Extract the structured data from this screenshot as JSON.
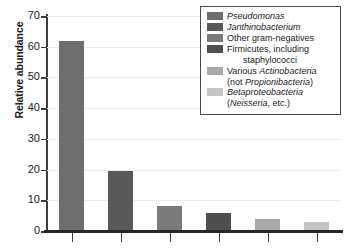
{
  "chart_data": {
    "type": "bar",
    "title": "",
    "xlabel": "",
    "ylabel": "Relative abundance",
    "ylim": [
      0,
      70
    ],
    "yticks": [
      0,
      10,
      20,
      30,
      40,
      50,
      60,
      70
    ],
    "grid": true,
    "legend_position": "top-right",
    "categories": [
      "Pseudomonas",
      "Janthinobacterium",
      "Other gram-negatives",
      "Firmicutes, including staphylococci",
      "Various Actinobacteria (not Propionibacteria)",
      "Betaproteobacteria (Neisseria, etc.)"
    ],
    "values": [
      62,
      19.5,
      8.3,
      6,
      4,
      3
    ],
    "colors": [
      "#6e6e6e",
      "#595959",
      "#7a7a7a",
      "#4f4f4f",
      "#a8a8a8",
      "#c4c4c4"
    ]
  },
  "axis": {
    "y_title": "Relative abundance",
    "tick_labels": [
      "70",
      "60",
      "50",
      "40",
      "30",
      "20",
      "10",
      "0"
    ]
  },
  "legend": {
    "entries": [
      {
        "swatch": "#6e6e6e",
        "line1_pre": "",
        "line1_italic": "Pseudomonas",
        "line1_post": "",
        "line2": "",
        "line2_italic": "",
        "line2_post": ""
      },
      {
        "swatch": "#595959",
        "line1_pre": "",
        "line1_italic": "Janthinobacterium",
        "line1_post": "",
        "line2": "",
        "line2_italic": "",
        "line2_post": ""
      },
      {
        "swatch": "#7a7a7a",
        "line1_pre": "Other gram-negatives",
        "line1_italic": "",
        "line1_post": "",
        "line2": "",
        "line2_italic": "",
        "line2_post": ""
      },
      {
        "swatch": "#4f4f4f",
        "line1_pre": "Firmicutes, including",
        "line1_italic": "",
        "line1_post": "",
        "line2": "staphylococci",
        "line2_italic": "",
        "line2_post": ""
      },
      {
        "swatch": "#a8a8a8",
        "line1_pre": "Various ",
        "line1_italic": "Actinobacteria",
        "line1_post": "",
        "line2": "(not ",
        "line2_italic": "Propionibacteria",
        "line2_post": ")"
      },
      {
        "swatch": "#c4c4c4",
        "line1_pre": "",
        "line1_italic": "Betaproteobacteria",
        "line1_post": "",
        "line2": "(",
        "line2_italic": "Neisseria",
        "line2_post": ", etc.)"
      }
    ]
  }
}
